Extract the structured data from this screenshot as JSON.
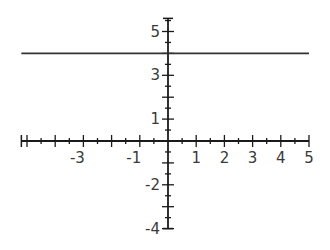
{
  "chart_data": {
    "type": "line",
    "title": "",
    "xlabel": "",
    "ylabel": "",
    "xlim": [
      -5.2,
      5
    ],
    "ylim": [
      -4,
      5.6
    ],
    "grid": false,
    "legend": null,
    "x_tick_labels": [
      "-3",
      "-1",
      "1",
      "2",
      "3",
      "4",
      "5"
    ],
    "x_tick_values": [
      -3,
      -1,
      1,
      2,
      3,
      4,
      5
    ],
    "y_tick_labels": [
      "5",
      "3",
      "1",
      "-2",
      "-4"
    ],
    "y_tick_values": [
      5,
      3,
      1,
      -2,
      -4
    ],
    "series": [
      {
        "name": "y = 4",
        "x": [
          -5.2,
          5
        ],
        "y": [
          4,
          4
        ],
        "color": "#333333"
      }
    ]
  },
  "colors": {
    "axis": "#1a1a1a",
    "line": "#333333",
    "text": "#3a3a3a"
  }
}
